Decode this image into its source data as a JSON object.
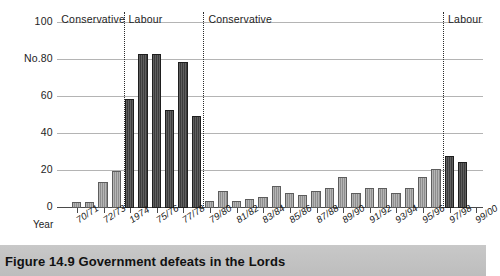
{
  "figure": {
    "caption_number": "Figure 14.9",
    "caption_title": "Government defeats in the Lords",
    "caption_full": "Figure 14.9  Government defeats in the Lords"
  },
  "axes": {
    "y_title": "No.",
    "x_title": "Year",
    "y_ticks": [
      "100",
      "80",
      "60",
      "40",
      "20",
      "0"
    ]
  },
  "era_labels": [
    {
      "label": "Conservative"
    },
    {
      "label": "Labour"
    },
    {
      "label": "Conservative"
    },
    {
      "label": "Labour"
    }
  ],
  "chart_data": {
    "type": "bar",
    "title": "Government defeats in the Lords",
    "xlabel": "Year",
    "ylabel": "No.",
    "ylim": [
      0,
      100
    ],
    "ytick_values": [
      0,
      20,
      40,
      60,
      80,
      100
    ],
    "grid": true,
    "legend": "none",
    "series_name": "Government defeats",
    "categories": [
      "69/70",
      "70/71",
      "71/72",
      "72/73",
      "73/74",
      "1974",
      "74/75",
      "75/76",
      "76/77",
      "77/78",
      "78/79",
      "79/80",
      "80/81",
      "81/82",
      "82/83",
      "83/84",
      "84/85",
      "85/86",
      "86/87",
      "87/88",
      "88/89",
      "89/90",
      "90/91",
      "91/92",
      "92/93",
      "93/94",
      "94/95",
      "95/96",
      "96/97",
      "97/98",
      "98/99",
      "99/00"
    ],
    "values": [
      0,
      3,
      3,
      14,
      20,
      59,
      83,
      83,
      53,
      79,
      50,
      4,
      9,
      4,
      5,
      6,
      12,
      8,
      7,
      9,
      11,
      17,
      8,
      11,
      11,
      8,
      11,
      17,
      21,
      28,
      25,
      0
    ],
    "tick_labels": [
      "70/71",
      "72/73",
      "1974",
      "75/76",
      "77/78",
      "79/80",
      "81/82",
      "83/84",
      "85/86",
      "87/88",
      "89/90",
      "91/92",
      "93/94",
      "95/96",
      "97/98",
      "99/00"
    ],
    "era_spans": [
      {
        "label": "Conservative",
        "from": "69/70",
        "to": "73/74"
      },
      {
        "label": "Labour",
        "from": "1974",
        "to": "78/79"
      },
      {
        "label": "Conservative",
        "from": "79/80",
        "to": "96/97"
      },
      {
        "label": "Labour",
        "from": "97/98",
        "to": "99/00"
      }
    ],
    "colors": {
      "bar_light": "#8e8e8e",
      "bar_dark": "#3c3c3c",
      "gridline": "#b4b4b4",
      "axis": "#4a4a4a",
      "caption_band": "#c4c4c4"
    }
  }
}
